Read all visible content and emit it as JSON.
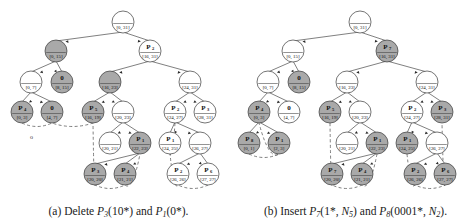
{
  "figure": {
    "panels": [
      {
        "id": "a",
        "caption_prefix": "(a)",
        "caption_verb": "Delete",
        "caption_items": [
          "P3(10*)",
          "P1(0*)"
        ],
        "caption_full": "(a) Delete P3(10*) and P1(0*).",
        "tree": {
          "nodes": [
            {
              "id": "r",
              "top": "",
              "sub": "",
              "range": "[0, 31]",
              "x": 123,
              "y": 22,
              "shaded": false
            },
            {
              "id": "l1",
              "top": "",
              "sub": "",
              "range": "[0, 15]",
              "x": 56,
              "y": 51,
              "shaded": true
            },
            {
              "id": "r1",
              "top": "P",
              "sub": "2",
              "range": "[16, 31]",
              "x": 150,
              "y": 51,
              "shaded": false
            },
            {
              "id": "a2",
              "top": "",
              "sub": "",
              "range": "[0, 7]",
              "x": 31,
              "y": 82,
              "shaded": false
            },
            {
              "id": "b2",
              "top": "0",
              "sub": "",
              "range": "[8, 15]",
              "x": 62,
              "y": 82,
              "shaded": true
            },
            {
              "id": "c2",
              "top": "",
              "sub": "",
              "range": "[16, 23]",
              "x": 110,
              "y": 82,
              "shaded": true
            },
            {
              "id": "d2",
              "top": "",
              "sub": "",
              "range": "[24, 31]",
              "x": 190,
              "y": 82,
              "shaded": false
            },
            {
              "id": "a3",
              "top": "P",
              "sub": "4",
              "range": "[0, 3]",
              "x": 22,
              "y": 112,
              "shaded": true
            },
            {
              "id": "b3",
              "top": "0",
              "sub": "",
              "range": "[4, 7]",
              "x": 52,
              "y": 112,
              "shaded": true
            },
            {
              "id": "c3",
              "top": "P",
              "sub": "5",
              "range": "[16, 19]",
              "x": 93,
              "y": 112,
              "shaded": true
            },
            {
              "id": "d3",
              "top": "",
              "sub": "",
              "range": "[20, 23]",
              "x": 123,
              "y": 112,
              "shaded": false
            },
            {
              "id": "e3",
              "top": "P",
              "sub": "2",
              "range": "[24, 27]",
              "x": 175,
              "y": 112,
              "shaded": false
            },
            {
              "id": "f3",
              "top": "P",
              "sub": "3",
              "range": "[28, 31]",
              "x": 205,
              "y": 112,
              "shaded": false
            },
            {
              "id": "c4",
              "top": "",
              "sub": "",
              "range": "[20, 21]",
              "x": 110,
              "y": 143,
              "shaded": false
            },
            {
              "id": "d4",
              "top": "P",
              "sub": "1",
              "range": "[22, 23]",
              "x": 140,
              "y": 143,
              "shaded": true
            },
            {
              "id": "e4",
              "top": "P",
              "sub": "1",
              "range": "[24, 25]",
              "x": 170,
              "y": 143,
              "shaded": false
            },
            {
              "id": "f4",
              "top": "",
              "sub": "",
              "range": "[26, 27]",
              "x": 200,
              "y": 143,
              "shaded": false
            },
            {
              "id": "c5",
              "top": "P",
              "sub": "3",
              "range": "[20, 20]",
              "x": 95,
              "y": 174,
              "shaded": true
            },
            {
              "id": "d5",
              "top": "P",
              "sub": "4",
              "range": "[21, 21]",
              "x": 125,
              "y": 174,
              "shaded": true
            },
            {
              "id": "e5",
              "top": "P",
              "sub": "2",
              "range": "[26, 26]",
              "x": 178,
              "y": 174,
              "shaded": false
            },
            {
              "id": "f5",
              "top": "P",
              "sub": "6",
              "range": "[27, 27]",
              "x": 208,
              "y": 174,
              "shaded": false
            }
          ],
          "edges": [
            [
              "r",
              "l1"
            ],
            [
              "r",
              "r1"
            ],
            [
              "l1",
              "a2"
            ],
            [
              "l1",
              "b2"
            ],
            [
              "r1",
              "c2"
            ],
            [
              "r1",
              "d2"
            ],
            [
              "a2",
              "a3"
            ],
            [
              "a2",
              "b3"
            ],
            [
              "c2",
              "c3"
            ],
            [
              "c2",
              "d3"
            ],
            [
              "d2",
              "e3"
            ],
            [
              "d2",
              "f3"
            ],
            [
              "d3",
              "c4"
            ],
            [
              "d3",
              "d4"
            ],
            [
              "e3",
              "e4"
            ],
            [
              "e3",
              "f4"
            ],
            [
              "d4",
              "c5"
            ],
            [
              "d4",
              "d5"
            ],
            [
              "f4",
              "e5"
            ],
            [
              "f4",
              "f5"
            ]
          ],
          "marks": [
            "o"
          ]
        }
      },
      {
        "id": "b",
        "caption_prefix": "(b)",
        "caption_verb": "Insert",
        "caption_items": [
          "P7(1*, N5)",
          "P8(0001*, N2)"
        ],
        "caption_full": "(b) Insert P7(1*, N5) and P8(0001*, N2).",
        "tree": {
          "nodes": [
            {
              "id": "r",
              "top": "",
              "sub": "",
              "range": "[0, 31]",
              "x": 123,
              "y": 22,
              "shaded": false
            },
            {
              "id": "l1",
              "top": "",
              "sub": "",
              "range": "[0, 15]",
              "x": 56,
              "y": 51,
              "shaded": false
            },
            {
              "id": "r1",
              "top": "P",
              "sub": "7",
              "range": "[16, 31]",
              "x": 150,
              "y": 51,
              "shaded": true
            },
            {
              "id": "a2",
              "top": "",
              "sub": "",
              "range": "[0, 7]",
              "x": 31,
              "y": 82,
              "shaded": false
            },
            {
              "id": "b2",
              "top": "0",
              "sub": "",
              "range": "[8, 15]",
              "x": 62,
              "y": 82,
              "shaded": true
            },
            {
              "id": "c2",
              "top": "",
              "sub": "",
              "range": "[16, 23]",
              "x": 110,
              "y": 82,
              "shaded": false
            },
            {
              "id": "d2",
              "top": "",
              "sub": "",
              "range": "[24, 31]",
              "x": 190,
              "y": 82,
              "shaded": false
            },
            {
              "id": "a3",
              "top": "P",
              "sub": "4",
              "range": "[0, 3]",
              "x": 22,
              "y": 112,
              "shaded": true
            },
            {
              "id": "b3",
              "top": "0",
              "sub": "",
              "range": "[4, 7]",
              "x": 52,
              "y": 112,
              "shaded": false
            },
            {
              "id": "c3",
              "top": "P",
              "sub": "5",
              "range": "[16, 19]",
              "x": 93,
              "y": 112,
              "shaded": true
            },
            {
              "id": "d3",
              "top": "",
              "sub": "",
              "range": "[20, 23]",
              "x": 123,
              "y": 112,
              "shaded": false
            },
            {
              "id": "e3",
              "top": "P",
              "sub": "2",
              "range": "[24, 27]",
              "x": 175,
              "y": 112,
              "shaded": false
            },
            {
              "id": "f3",
              "top": "P",
              "sub": "3",
              "range": "[28, 31]",
              "x": 205,
              "y": 112,
              "shaded": true
            },
            {
              "id": "a4",
              "top": "P",
              "sub": "8",
              "range": "[0, 1]",
              "x": 12,
              "y": 143,
              "shaded": true
            },
            {
              "id": "b4",
              "top": "P",
              "sub": "1",
              "range": "[2, 3]",
              "x": 42,
              "y": 143,
              "shaded": true
            },
            {
              "id": "c4",
              "top": "",
              "sub": "",
              "range": "[20, 21]",
              "x": 110,
              "y": 143,
              "shaded": false
            },
            {
              "id": "d4",
              "top": "P",
              "sub": "1",
              "range": "[22, 23]",
              "x": 140,
              "y": 143,
              "shaded": true
            },
            {
              "id": "e4",
              "top": "P",
              "sub": "1",
              "range": "[24, 25]",
              "x": 170,
              "y": 143,
              "shaded": true
            },
            {
              "id": "f4",
              "top": "",
              "sub": "",
              "range": "[26, 27]",
              "x": 200,
              "y": 143,
              "shaded": false
            },
            {
              "id": "c5",
              "top": "P",
              "sub": "7",
              "range": "[20, 20]",
              "x": 95,
              "y": 174,
              "shaded": true
            },
            {
              "id": "d5",
              "top": "P",
              "sub": "4",
              "range": "[21, 21]",
              "x": 125,
              "y": 174,
              "shaded": true
            },
            {
              "id": "e5",
              "top": "P",
              "sub": "2",
              "range": "[26, 26]",
              "x": 178,
              "y": 174,
              "shaded": true
            },
            {
              "id": "f5",
              "top": "P",
              "sub": "6",
              "range": "[27, 27]",
              "x": 208,
              "y": 174,
              "shaded": true
            }
          ],
          "edges": [
            [
              "r",
              "l1"
            ],
            [
              "r",
              "r1"
            ],
            [
              "l1",
              "a2"
            ],
            [
              "l1",
              "b2"
            ],
            [
              "r1",
              "c2"
            ],
            [
              "r1",
              "d2"
            ],
            [
              "a2",
              "a3"
            ],
            [
              "a2",
              "b3"
            ],
            [
              "c2",
              "c3"
            ],
            [
              "c2",
              "d3"
            ],
            [
              "d2",
              "e3"
            ],
            [
              "d2",
              "f3"
            ],
            [
              "a3",
              "a4"
            ],
            [
              "a3",
              "b4"
            ],
            [
              "d3",
              "c4"
            ],
            [
              "d3",
              "d4"
            ],
            [
              "e3",
              "e4"
            ],
            [
              "e3",
              "f4"
            ],
            [
              "d4",
              "c5"
            ],
            [
              "d4",
              "d5"
            ],
            [
              "f4",
              "e5"
            ],
            [
              "f4",
              "f5"
            ]
          ],
          "marks": []
        }
      }
    ],
    "style": {
      "node_radius": 11,
      "shaded_fill": "#a9a9a9",
      "plain_fill": "#ffffff",
      "stroke": "#3a3a3a",
      "dashed_stroke": "#555555",
      "text_color": "#111111"
    }
  }
}
